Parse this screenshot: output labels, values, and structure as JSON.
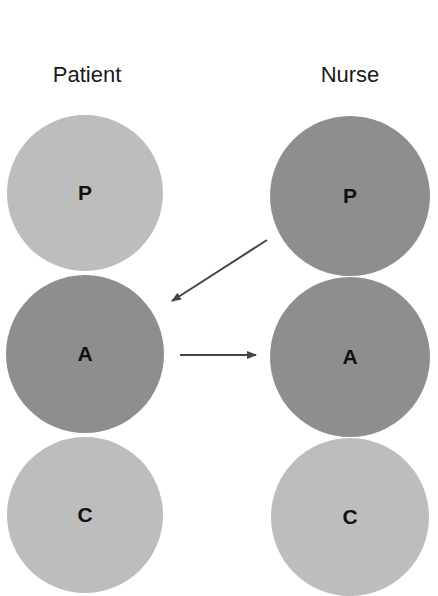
{
  "columns": [
    {
      "title": "Patient",
      "states": [
        {
          "label": "P",
          "shade": "light"
        },
        {
          "label": "A",
          "shade": "dark"
        },
        {
          "label": "C",
          "shade": "light"
        }
      ]
    },
    {
      "title": "Nurse",
      "states": [
        {
          "label": "P",
          "shade": "dark"
        },
        {
          "label": "A",
          "shade": "dark"
        },
        {
          "label": "C",
          "shade": "light"
        }
      ]
    }
  ],
  "arrows": [
    {
      "from": "Nurse.P",
      "to": "Patient.A"
    },
    {
      "from": "Patient.A",
      "to": "Nurse.A"
    }
  ],
  "colors": {
    "light": "#bcbcbc",
    "dark": "#8e8e8e",
    "arrow": "#444444"
  }
}
